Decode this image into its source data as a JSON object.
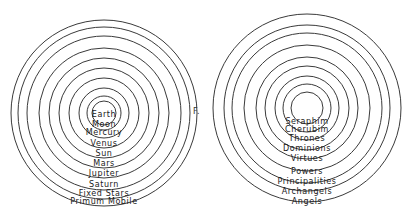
{
  "diagrams": [
    {
      "name": "celestial-spheres",
      "center": [
        104,
        113
      ],
      "rings": [
        {
          "label": "Earth",
          "r": 12,
          "label_y": 117,
          "label_inside": true
        },
        {
          "label": "Moon",
          "r": 17,
          "label_y": 127
        },
        {
          "label": "Mercury",
          "r": 25,
          "label_y": 135
        },
        {
          "label": "Venus",
          "r": 35,
          "label_y": 146
        },
        {
          "label": "Sun",
          "r": 45,
          "label_y": 156
        },
        {
          "label": "Mars",
          "r": 55,
          "label_y": 166
        },
        {
          "label": "Jupiter",
          "r": 65,
          "label_y": 176
        },
        {
          "label": "Saturn",
          "r": 77,
          "label_y": 187
        },
        {
          "label": "Fixed Stars",
          "r": 86,
          "label_y": 196
        },
        {
          "label": "Primum Mobile",
          "r": 93,
          "label_y": 204
        }
      ]
    },
    {
      "name": "angelic-hierarchy",
      "center": [
        307,
        108
      ],
      "rings": [
        {
          "label": "Seraphim",
          "r": 16,
          "label_y": 124
        },
        {
          "label": "Cherubim",
          "r": 24,
          "label_y": 132
        },
        {
          "label": "Thrones",
          "r": 32,
          "label_y": 141
        },
        {
          "label": "Dominions",
          "r": 42,
          "label_y": 151
        },
        {
          "label": "Virtues",
          "r": 51,
          "label_y": 161
        },
        {
          "label": "Powers",
          "r": 63,
          "label_y": 174
        },
        {
          "label": "Principalities",
          "r": 75,
          "label_y": 184
        },
        {
          "label": "Archangels",
          "r": 83,
          "label_y": 194
        },
        {
          "label": "Angels",
          "r": 94,
          "label_y": 204
        }
      ]
    }
  ],
  "stray_mark": {
    "text": "F.",
    "x": 193,
    "y": 114
  }
}
